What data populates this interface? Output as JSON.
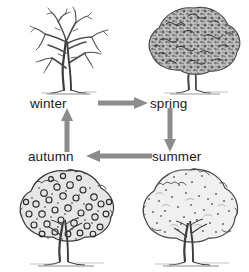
{
  "diagram": {
    "background_color": "#ffffff",
    "arrow_color": "#8c8c8c",
    "text_color": "#1a1a1a",
    "nodes": [
      {
        "id": "winter",
        "label": "winter",
        "icon": "bare-tree-icon",
        "description": "bare deciduous tree with no leaves"
      },
      {
        "id": "spring",
        "label": "spring",
        "icon": "blossoming-tree-icon",
        "description": "tree with dense dark new foliage"
      },
      {
        "id": "summer",
        "label": "summer",
        "icon": "full-leaf-tree-icon",
        "description": "tree with full light green canopy"
      },
      {
        "id": "autumn",
        "label": "autumn",
        "icon": "fruiting-tree-icon",
        "description": "tree with round fruit among leaves"
      }
    ],
    "arrows": [
      {
        "id": "winter-spring",
        "from": "winter",
        "to": "spring",
        "direction": "right"
      },
      {
        "id": "spring-summer",
        "from": "spring",
        "to": "summer",
        "direction": "down"
      },
      {
        "id": "summer-autumn",
        "from": "summer",
        "to": "autumn",
        "direction": "left"
      },
      {
        "id": "autumn-winter",
        "from": "autumn",
        "to": "winter",
        "direction": "up"
      }
    ]
  }
}
